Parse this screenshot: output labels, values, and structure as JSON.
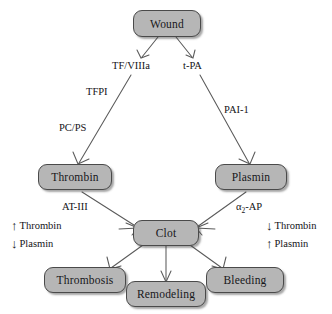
{
  "diagram": {
    "background_color": "#ffffff",
    "node_fill": "#b6b6b6",
    "node_border": "#4a4a4a",
    "text_color": "#141417",
    "nodes": {
      "wound": "Wound",
      "thrombin": "Thrombin",
      "plasmin": "Plasmin",
      "clot": "Clot",
      "thrombosis": "Thrombosis",
      "remodeling": "Remodeling",
      "bleeding": "Bleeding"
    },
    "edge_labels": {
      "tf_viiia": "TF/VIIIa",
      "t_pa": "t-PA",
      "tfpi": "TFPI",
      "pc_ps": "PC/PS",
      "pai_1": "PAI-1",
      "at_iii": "AT-III",
      "a2_ap_prefix": "α",
      "a2_ap_sub": "2",
      "a2_ap_suffix": "-AP"
    },
    "annotations": {
      "left": [
        {
          "arrow": "↑",
          "label": "Thrombin"
        },
        {
          "arrow": "↓",
          "label": "Plasmin"
        }
      ],
      "right": [
        {
          "arrow": "↓",
          "label": "Thrombin"
        },
        {
          "arrow": "↑",
          "label": "Plasmin"
        }
      ]
    }
  }
}
